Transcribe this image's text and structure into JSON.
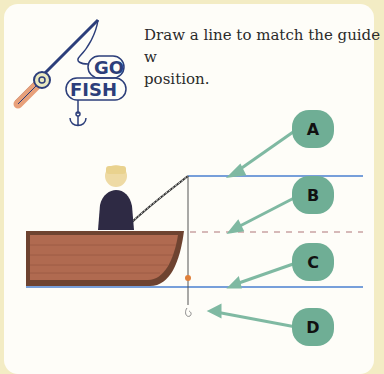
{
  "instruction": "Draw a line to match the guide with its position.",
  "instruction_line1": "Draw a line to match the guide w",
  "instruction_line2": "position.",
  "logo": {
    "line1": "GO",
    "line2": "FISH",
    "icon": "fishing-rod-icon"
  },
  "labels": [
    "A",
    "B",
    "C",
    "D"
  ],
  "colors": {
    "bubble": "#6fae95",
    "guide_line": "#4a7fd0",
    "dashed_line": "#c9a3a3",
    "boat": "#a8644a",
    "page_border": "#f3ecc4"
  }
}
